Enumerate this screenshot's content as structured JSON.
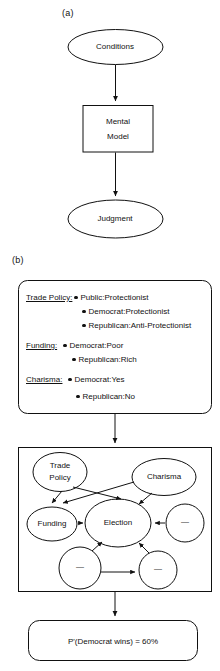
{
  "figure": {
    "panels": [
      {
        "id": "a",
        "label": "(a)"
      },
      {
        "id": "b",
        "label": "(b)"
      }
    ]
  },
  "panel_a": {
    "label": "(a)",
    "nodes": [
      {
        "name": "conditions",
        "shape": "ellipse",
        "label": "Conditions"
      },
      {
        "name": "mental-model",
        "shape": "rect",
        "label_line1": "Mental",
        "label_line2": "Model"
      },
      {
        "name": "judgment",
        "shape": "ellipse",
        "label": "Judgment"
      }
    ],
    "edges": [
      {
        "from": "Conditions",
        "to": "Mental Model"
      },
      {
        "from": "Mental Model",
        "to": "Judgment"
      }
    ]
  },
  "panel_b": {
    "label": "(b)",
    "evidence_box": {
      "name": "evidence-box",
      "groups": [
        {
          "category": "Trade Policy:",
          "items": [
            "Public:Protectionist",
            "Democrat:Protectionist",
            "Republican:Anti-Protectionist"
          ]
        },
        {
          "category": "Funding:",
          "items": [
            "Democrat:Poor",
            "Republican:Rich"
          ]
        },
        {
          "category": "Charisma:",
          "items": [
            "Democrat:Yes",
            "Republican:No"
          ]
        }
      ]
    },
    "network_box": {
      "name": "bayesian-network-box",
      "nodes": [
        {
          "name": "node-trade-policy",
          "label_line1": "Trade",
          "label_line2": "Policy",
          "labeled": true
        },
        {
          "name": "node-charisma",
          "label": "Charisma",
          "labeled": true
        },
        {
          "name": "node-funding",
          "label": "Funding",
          "labeled": true
        },
        {
          "name": "node-election",
          "label": "Election",
          "labeled": true
        },
        {
          "name": "node-unlabeled-right",
          "label": "—",
          "labeled": false
        },
        {
          "name": "node-unlabeled-bottom-left",
          "label": "—",
          "labeled": false
        },
        {
          "name": "node-unlabeled-bottom-right",
          "label": "—",
          "labeled": false
        }
      ],
      "edges": [
        {
          "from": "Trade Policy",
          "to": "Funding"
        },
        {
          "from": "Trade Policy",
          "to": "Election"
        },
        {
          "from": "Charisma",
          "to": "Funding"
        },
        {
          "from": "Charisma",
          "to": "Election"
        },
        {
          "from": "Funding",
          "to": "Election"
        },
        {
          "from": "node-unlabeled-right",
          "to": "Election"
        },
        {
          "from": "node-unlabeled-bottom-left",
          "to": "Election"
        },
        {
          "from": "node-unlabeled-bottom-left",
          "to": "node-unlabeled-bottom-right"
        },
        {
          "from": "node-unlabeled-bottom-right",
          "to": "Election"
        }
      ]
    },
    "result_box": {
      "name": "result-box",
      "text": "P'(Democrat wins) = 60%"
    },
    "edges": [
      {
        "from": "evidence-box",
        "to": "bayesian-network-box"
      },
      {
        "from": "bayesian-network-box",
        "to": "result-box"
      }
    ]
  },
  "colors": {
    "stroke": "#111111",
    "background": "#ffffff"
  }
}
